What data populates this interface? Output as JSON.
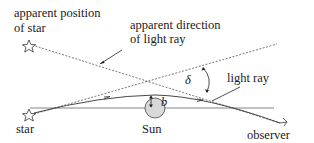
{
  "diagram": {
    "labels": {
      "apparent_position_line1": "apparent position",
      "apparent_position_line2": "of star",
      "apparent_direction_line1": "apparent direction",
      "apparent_direction_line2": "of light ray",
      "light_ray": "light ray",
      "star": "star",
      "sun": "Sun",
      "observer": "observer",
      "deflection_angle": "δ",
      "impact_parameter": "b"
    },
    "colors": {
      "line": "#333333",
      "dashed": "#555555",
      "sun_fill": "#d9d9d9",
      "text": "#1a1a1a"
    }
  }
}
